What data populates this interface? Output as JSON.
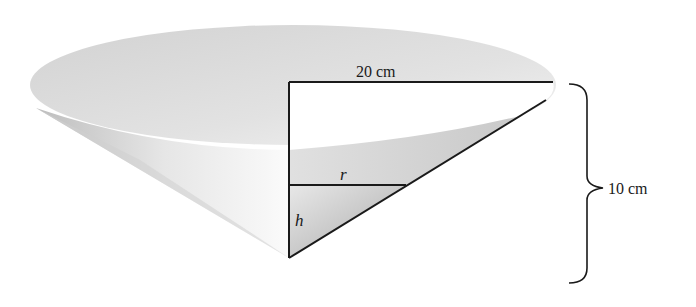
{
  "diagram": {
    "type": "cone-cross-section",
    "labels": {
      "top_radius": "20 cm",
      "height": "10 cm",
      "inner_radius": "r",
      "inner_height": "h"
    },
    "colors": {
      "line": "#1a1a1a",
      "rim_fill": "#d9d9d9",
      "cone_shade": "#bdbdbd",
      "triangle_fill": "#c8c8c8",
      "background": "#ffffff"
    }
  }
}
